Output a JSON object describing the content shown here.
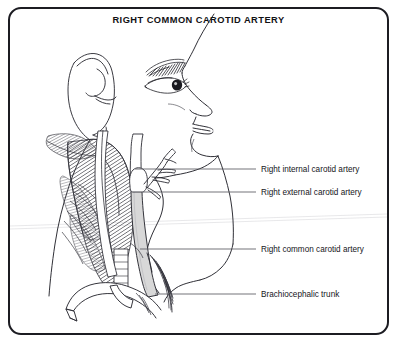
{
  "figure": {
    "title": "RIGHT COMMON CAROTID ARTERY",
    "type": "anatomical-illustration",
    "orientation": "profile facing right",
    "background_color": "#ffffff",
    "line_color": "#1c1c22",
    "border_color": "#1c1c22",
    "artery_fill_color": "#d8d8d8",
    "muscle_hatch_color": "#3a3a42"
  },
  "labels": [
    {
      "id": "internal-carotid",
      "text": "Right internal carotid artery",
      "x": 261,
      "y": 171,
      "leader": {
        "x1": 135,
        "y1": 169,
        "x2": 256,
        "y2": 169
      }
    },
    {
      "id": "external-carotid",
      "text": "Right external carotid artery",
      "x": 261,
      "y": 194,
      "leader": {
        "x1": 143,
        "y1": 192,
        "x2": 256,
        "y2": 192
      }
    },
    {
      "id": "common-carotid",
      "text": "Right common carotid artery",
      "x": 261,
      "y": 251,
      "leader": {
        "x1": 140,
        "y1": 249,
        "x2": 256,
        "y2": 249
      }
    },
    {
      "id": "brachiocephalic-trunk",
      "text": "Brachiocephalic  trunk",
      "x": 261,
      "y": 296,
      "leader": {
        "x1": 155,
        "y1": 294,
        "x2": 256,
        "y2": 294
      }
    }
  ],
  "anatomy_parts": [
    {
      "name": "ear",
      "label": "auricle"
    },
    {
      "name": "eyebrow",
      "label": "eyebrow"
    },
    {
      "name": "eye",
      "label": "eye"
    },
    {
      "name": "nose",
      "label": "nose"
    },
    {
      "name": "lips",
      "label": "lips"
    },
    {
      "name": "chin",
      "label": "chin"
    },
    {
      "name": "sternocleidomastoid",
      "label": "sternocleidomastoid muscle"
    },
    {
      "name": "common-carotid-artery",
      "label": "common carotid artery"
    },
    {
      "name": "internal-carotid-artery",
      "label": "internal carotid artery"
    },
    {
      "name": "external-carotid-artery",
      "label": "external carotid artery"
    },
    {
      "name": "carotid-bifurcation",
      "label": "carotid bifurcation"
    },
    {
      "name": "aortic-arch",
      "label": "aortic arch"
    },
    {
      "name": "brachiocephalic-trunk",
      "label": "brachiocephalic trunk"
    },
    {
      "name": "subclavian-artery",
      "label": "subclavian artery"
    },
    {
      "name": "trachea",
      "label": "trachea"
    },
    {
      "name": "clavicle",
      "label": "clavicle"
    }
  ]
}
